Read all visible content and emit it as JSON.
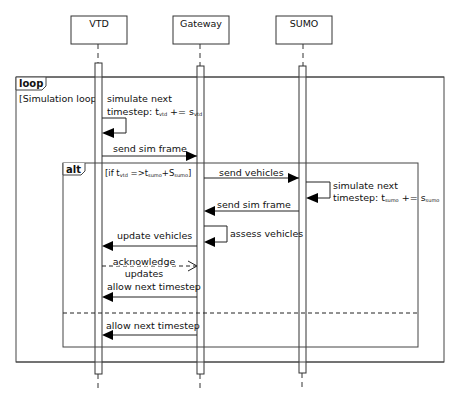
{
  "participants": [
    {
      "name": "VTD",
      "x": 98
    },
    {
      "name": "Gateway",
      "x": 200
    },
    {
      "name": "SUMO",
      "x": 303
    }
  ],
  "fragments": {
    "loop": {
      "keyword": "loop",
      "guard": "[Simulation loop]"
    },
    "alt": {
      "keyword": "alt",
      "guard_prefix": "[if t",
      "guard_sub1": "vtd",
      "guard_mid": " =>t",
      "guard_sub2": "sumo",
      "guard_plus": "+S",
      "guard_sub3": "sumo",
      "guard_end": "]"
    }
  },
  "messages": {
    "vtd_sim_line1": "simulate next",
    "vtd_sim_line2": "timestep: t",
    "vtd_sim_sub1": "vtd",
    "vtd_sim_op": " += s",
    "vtd_sim_sub2": "vtd",
    "send_sim_frame_1": "send sim frame",
    "send_vehicles": "send vehicles",
    "sumo_sim_line1": "simulate next",
    "sumo_sim_line2": "timestep: t",
    "sumo_sim_sub1": "sumo",
    "sumo_sim_op": " += s",
    "sumo_sim_sub2": "sumo",
    "send_sim_frame_2": "send sim frame",
    "assess_vehicles": "assess vehicles",
    "update_vehicles": "update vehicles",
    "acknowledge_line1": "acknowledge",
    "acknowledge_line2": "updates",
    "allow_next_1": "allow next timestep",
    "allow_next_2": "allow next timestep"
  }
}
